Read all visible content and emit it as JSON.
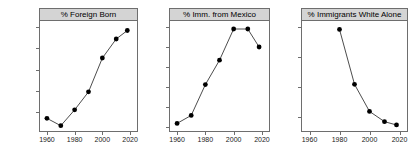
{
  "figure": {
    "background_color": "#ffffff",
    "strip_color": "#d4d4d4",
    "line_color": "#4d4d4d",
    "point_color": "#000000",
    "axis_color": "#6e6e6e",
    "panel_count": 3
  },
  "chart_data": [
    {
      "type": "line",
      "title": "% Foreign Born",
      "xlabel": "",
      "ylabel": "",
      "xlim": [
        1955,
        2025
      ],
      "ylim": [
        4.2,
        14.6
      ],
      "xticks": [
        1960,
        1980,
        2000,
        2020
      ],
      "xticklabels": [
        "1960",
        "1980",
        "2000",
        "2020"
      ],
      "yticks": [
        6,
        8,
        10,
        12,
        14
      ],
      "yticklabels": [
        "6%",
        "8%",
        "10%",
        "12%",
        "14%"
      ],
      "grid": false,
      "legend": "none",
      "x": [
        1960,
        1970,
        1980,
        1990,
        2000,
        2010,
        2018
      ],
      "values": [
        5.4,
        4.7,
        6.2,
        7.9,
        11.1,
        12.9,
        13.7
      ]
    },
    {
      "type": "line",
      "title": "% Imm. from Mexico",
      "xlabel": "",
      "ylabel": "",
      "xlim": [
        1955,
        2025
      ],
      "ylim": [
        4.0,
        31.5
      ],
      "xticks": [
        1960,
        1980,
        2000,
        2020
      ],
      "xticklabels": [
        "1960",
        "1980",
        "2000",
        "2020"
      ],
      "yticks": [
        5,
        10,
        15,
        20,
        25,
        30
      ],
      "yticklabels": [
        "5%",
        "10%",
        "15%",
        "20%",
        "25%",
        "30%"
      ],
      "grid": false,
      "legend": "none",
      "x": [
        1960,
        1970,
        1980,
        1990,
        2000,
        2010,
        2018
      ],
      "values": [
        5.9,
        7.9,
        15.6,
        21.7,
        29.5,
        29.5,
        25.0
      ]
    },
    {
      "type": "line",
      "title": "% Immigrants White Alone",
      "xlabel": "",
      "ylabel": "",
      "xlim": [
        1955,
        2025
      ],
      "ylim": [
        15.5,
        52.0
      ],
      "xticks": [
        1960,
        1980,
        2000,
        2020
      ],
      "xticklabels": [
        "1960",
        "1980",
        "2000",
        "2020"
      ],
      "yticks": [
        20,
        30,
        40,
        50
      ],
      "yticklabels": [
        "20%",
        "30%",
        "40%",
        "50%"
      ],
      "grid": false,
      "legend": "none",
      "x": [
        1980,
        1990,
        2000,
        2010,
        2018
      ],
      "values": [
        49.2,
        31.0,
        22.0,
        18.6,
        17.5
      ]
    }
  ]
}
